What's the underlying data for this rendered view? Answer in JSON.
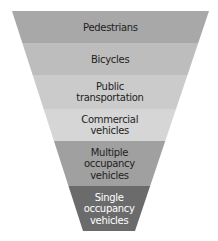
{
  "diagram": {
    "type": "funnel",
    "title": "",
    "levels": [
      {
        "label": [
          "Pedestrians"
        ],
        "fill": "#a8a8a8",
        "text_color": "#1e1e1e"
      },
      {
        "label": [
          "Bicycles"
        ],
        "fill": "#bdbdbd",
        "text_color": "#1e1e1e"
      },
      {
        "label": [
          "Public",
          "transportation"
        ],
        "fill": "#cbcbcb",
        "text_color": "#1e1e1e"
      },
      {
        "label": [
          "Commercial",
          "vehicles"
        ],
        "fill": "#d6d6d6",
        "text_color": "#1e1e1e"
      },
      {
        "label": [
          "Multiple",
          "occupancy",
          "vehicles"
        ],
        "fill": "#a0a0a0",
        "text_color": "#1e1e1e"
      },
      {
        "label": [
          "Single",
          "occupancy",
          "vehicles"
        ],
        "fill": "#6b6b6b",
        "text_color": "#ffffff"
      }
    ]
  }
}
